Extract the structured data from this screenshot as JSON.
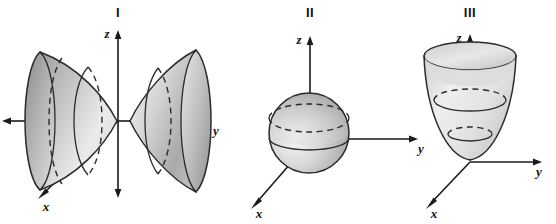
{
  "figure": {
    "background_color": "#ffffff",
    "ink_color": "#2b2b2b",
    "width": 556,
    "height": 224
  },
  "panels": [
    {
      "id": "I",
      "roman_label": "I",
      "surface_name": "hyperboloid-of-two-sheets",
      "axes": [
        {
          "name": "z",
          "label": "z"
        },
        {
          "name": "y",
          "label": "y"
        },
        {
          "name": "x",
          "label": "x"
        }
      ]
    },
    {
      "id": "II",
      "roman_label": "II",
      "surface_name": "sphere",
      "axes": [
        {
          "name": "z",
          "label": "z"
        },
        {
          "name": "y",
          "label": "y"
        },
        {
          "name": "x",
          "label": "x"
        }
      ]
    },
    {
      "id": "III",
      "roman_label": "III",
      "surface_name": "elliptic-paraboloid",
      "axes": [
        {
          "name": "z",
          "label": "z"
        },
        {
          "name": "y",
          "label": "y"
        },
        {
          "name": "x",
          "label": "x"
        }
      ]
    }
  ],
  "labels": {
    "panel1_roman": "I",
    "panel1_z": "z",
    "panel1_y": "y",
    "panel1_x": "x",
    "panel2_roman": "II",
    "panel2_z": "z",
    "panel2_y": "y",
    "panel2_x": "x",
    "panel3_roman": "III",
    "panel3_z": "z",
    "panel3_y": "y",
    "panel3_x": "x"
  },
  "colors": {
    "shade_light": "#f2f2f2",
    "shade_mid": "#c9c9c9",
    "shade_dark": "#9a9a9a",
    "outline": "#2b2b2b",
    "axis": "#1a1a1a"
  }
}
